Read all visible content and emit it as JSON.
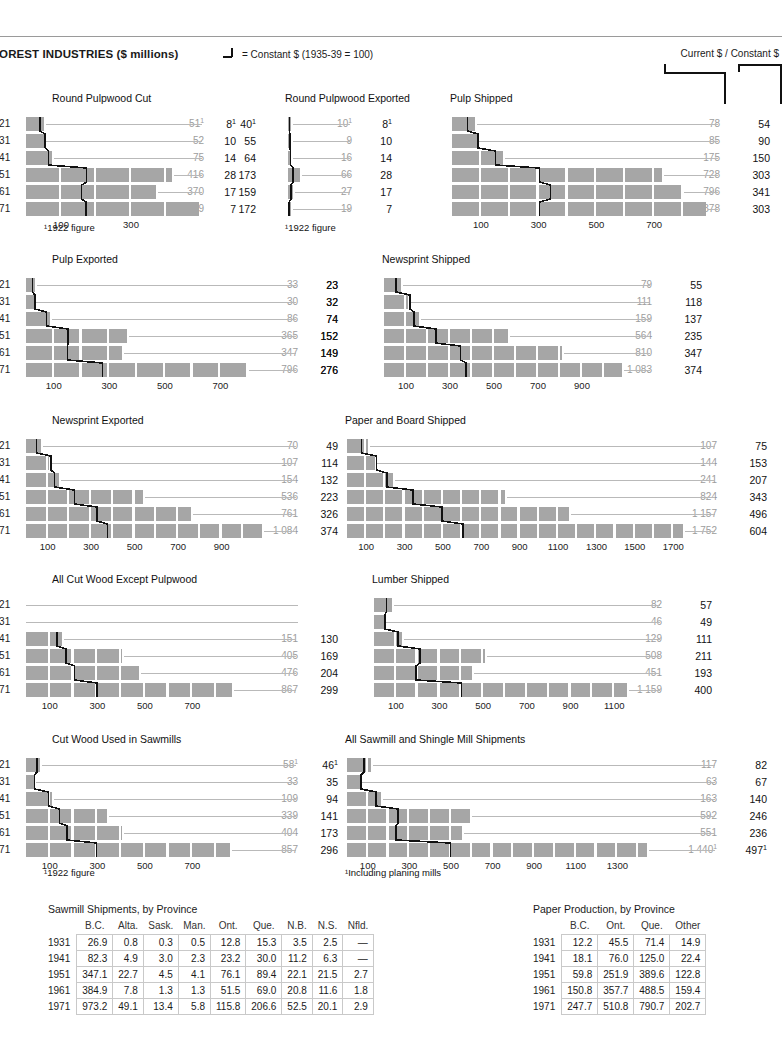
{
  "header": {
    "title": "FOREST INDUSTRIES ($ millions)",
    "legend_text": "= Constant $ (1935-39 = 100)",
    "legend_icon": "step-line-glyph",
    "columns_label": "Current $ / Constant $"
  },
  "years": [
    "1921",
    "1931",
    "1941",
    "1951",
    "1961",
    "1971"
  ],
  "table_years": [
    "1931",
    "1941",
    "1951",
    "1961",
    "1971"
  ],
  "footnotes": {
    "fig1922": "¹1922 figure",
    "planing": "¹Including planing mills"
  },
  "chart_data": [
    {
      "id": "round-pulpwood-cut",
      "type": "bar",
      "title": "Round Pulpwood Cut",
      "xlabel": "",
      "ylabel": "",
      "categories": [
        "1921",
        "1931",
        "1941",
        "1951",
        "1961",
        "1971"
      ],
      "xmax": 560,
      "ticks": [
        100,
        300
      ],
      "series": [
        {
          "name": "Current $",
          "values": [
            51,
            52,
            75,
            416,
            370,
            499
          ],
          "labels": [
            "51¹",
            "52",
            "75",
            "416",
            "370",
            "499"
          ]
        },
        {
          "name": "Constant $",
          "values": [
            40,
            55,
            64,
            173,
            159,
            172
          ],
          "labels": [
            "40¹",
            "55",
            "64",
            "173",
            "159",
            "172"
          ]
        }
      ],
      "footnote": "¹1922 figure",
      "left_values": null
    },
    {
      "id": "round-pulpwood-exported",
      "type": "bar",
      "title": "Round Pulpwood Exported",
      "categories": [
        "1921",
        "1931",
        "1941",
        "1951",
        "1961",
        "1971"
      ],
      "xmax": 560,
      "ticks": [],
      "series": [
        {
          "name": "Current $",
          "values": [
            10,
            9,
            16,
            66,
            27,
            19
          ],
          "labels": [
            "10¹",
            "9",
            "16",
            "66",
            "27",
            "19"
          ]
        },
        {
          "name": "Constant $",
          "values": [
            8,
            10,
            14,
            28,
            17,
            7
          ],
          "labels": [
            "8¹",
            "10",
            "14",
            "28",
            "17",
            "7"
          ]
        }
      ],
      "footnote": "¹1922 figure",
      "left_values": [
        "8¹",
        "10",
        "14",
        "28",
        "17",
        "7"
      ]
    },
    {
      "id": "pulp-shipped",
      "type": "bar",
      "title": "Pulp Shipped",
      "categories": [
        "1921",
        "1931",
        "1941",
        "1951",
        "1961",
        "1971"
      ],
      "xmax": 900,
      "ticks": [
        100,
        300,
        500,
        700
      ],
      "series": [
        {
          "name": "Current $",
          "values": [
            78,
            85,
            175,
            728,
            796,
            878
          ],
          "labels": [
            "78",
            "85",
            "175",
            "728",
            "796",
            "878"
          ]
        },
        {
          "name": "Constant $",
          "values": [
            54,
            90,
            150,
            303,
            341,
            303
          ],
          "labels": [
            "54",
            "90",
            "150",
            "303",
            "341",
            "303"
          ]
        }
      ],
      "footnote": null,
      "left_values": null
    },
    {
      "id": "pulp-exported",
      "type": "bar",
      "title": "Pulp Exported",
      "categories": [
        "1921",
        "1931",
        "1941",
        "1951",
        "1961",
        "1971"
      ],
      "xmax": 900,
      "ticks": [
        100,
        300,
        500,
        700
      ],
      "series": [
        {
          "name": "Current $",
          "values": [
            33,
            30,
            86,
            365,
            347,
            796
          ],
          "labels": [
            "33",
            "30",
            "86",
            "365",
            "347",
            "796"
          ]
        },
        {
          "name": "Constant $",
          "values": [
            23,
            32,
            74,
            152,
            149,
            276
          ],
          "labels": [
            "23",
            "32",
            "74",
            "152",
            "149",
            "276"
          ]
        }
      ],
      "footnote": null,
      "left_values": null
    },
    {
      "id": "newsprint-shipped",
      "type": "bar",
      "title": "Newsprint Shipped",
      "categories": [
        "1921",
        "1931",
        "1941",
        "1951",
        "1961",
        "1971"
      ],
      "xmax": 1150,
      "ticks": [
        100,
        300,
        500,
        700,
        900
      ],
      "series": [
        {
          "name": "Current $",
          "values": [
            79,
            111,
            159,
            564,
            810,
            1083
          ],
          "labels": [
            "79",
            "111",
            "159",
            "564",
            "810",
            "1 083"
          ]
        },
        {
          "name": "Constant $",
          "values": [
            55,
            118,
            137,
            235,
            347,
            374
          ],
          "labels": [
            "55",
            "118",
            "137",
            "235",
            "347",
            "374"
          ]
        }
      ],
      "footnote": null,
      "left_values": [
        "23",
        "32",
        "74",
        "152",
        "149",
        "276"
      ]
    },
    {
      "id": "newsprint-exported",
      "type": "bar",
      "title": "Newsprint Exported",
      "categories": [
        "1921",
        "1931",
        "1941",
        "1951",
        "1961",
        "1971"
      ],
      "xmax": 1150,
      "ticks": [
        100,
        300,
        500,
        700,
        900
      ],
      "series": [
        {
          "name": "Current $",
          "values": [
            70,
            107,
            154,
            536,
            761,
            1084
          ],
          "labels": [
            "70",
            "107",
            "154",
            "536",
            "761",
            "1 084"
          ]
        },
        {
          "name": "Constant $",
          "values": [
            49,
            114,
            132,
            223,
            326,
            374
          ],
          "labels": [
            "49",
            "114",
            "132",
            "223",
            "326",
            "374"
          ]
        }
      ],
      "footnote": null,
      "left_values": null
    },
    {
      "id": "paper-and-board-shipped",
      "type": "bar",
      "title": "Paper and Board Shipped",
      "categories": [
        "1921",
        "1931",
        "1941",
        "1951",
        "1961",
        "1971"
      ],
      "xmax": 1850,
      "ticks": [
        100,
        300,
        500,
        700,
        900,
        1100,
        1300,
        1500,
        1700
      ],
      "series": [
        {
          "name": "Current $",
          "values": [
            107,
            144,
            241,
            824,
            1157,
            1752
          ],
          "labels": [
            "107",
            "144",
            "241",
            "824",
            "1 157",
            "1 752"
          ]
        },
        {
          "name": "Constant $",
          "values": [
            75,
            153,
            207,
            343,
            496,
            604
          ],
          "labels": [
            "75",
            "153",
            "207",
            "343",
            "496",
            "604"
          ]
        }
      ],
      "footnote": null,
      "left_values": null
    },
    {
      "id": "all-cut-wood-except-pulpwood",
      "type": "bar",
      "title": "All Cut Wood Except Pulpwood",
      "categories": [
        "1921",
        "1931",
        "1941",
        "1951",
        "1961",
        "1971"
      ],
      "xmax": 900,
      "ticks": [
        100,
        300,
        500,
        700
      ],
      "series": [
        {
          "name": "Current $",
          "values": [
            null,
            null,
            151,
            405,
            476,
            867
          ],
          "labels": [
            "",
            "",
            "151",
            "405",
            "476",
            "867"
          ]
        },
        {
          "name": "Constant $",
          "values": [
            null,
            null,
            130,
            169,
            204,
            299
          ],
          "labels": [
            "",
            "",
            "130",
            "169",
            "204",
            "299"
          ]
        }
      ],
      "footnote": null,
      "left_values": [
        "",
        "",
        "130",
        "169",
        "204",
        "299"
      ]
    },
    {
      "id": "lumber-shipped",
      "type": "bar",
      "title": "Lumber Shipped",
      "categories": [
        "1921",
        "1931",
        "1941",
        "1951",
        "1961",
        "1971"
      ],
      "xmax": 1250,
      "ticks": [
        100,
        300,
        500,
        700,
        900,
        1100
      ],
      "series": [
        {
          "name": "Current $",
          "values": [
            82,
            46,
            129,
            508,
            451,
            1159
          ],
          "labels": [
            "82",
            "46",
            "129",
            "508",
            "451",
            "1 159"
          ]
        },
        {
          "name": "Constant $",
          "values": [
            57,
            49,
            111,
            211,
            193,
            400
          ],
          "labels": [
            "57",
            "49",
            "111",
            "211",
            "193",
            "400"
          ]
        }
      ],
      "footnote": null,
      "left_values": null
    },
    {
      "id": "cut-wood-used-in-sawmills",
      "type": "bar",
      "title": "Cut Wood Used in Sawmills",
      "categories": [
        "1921",
        "1931",
        "1941",
        "1951",
        "1961",
        "1971"
      ],
      "xmax": 900,
      "ticks": [
        100,
        300,
        500,
        700
      ],
      "series": [
        {
          "name": "Current $",
          "values": [
            58,
            33,
            109,
            339,
            404,
            857
          ],
          "labels": [
            "58¹",
            "33",
            "109",
            "339",
            "404",
            "857"
          ]
        },
        {
          "name": "Constant $",
          "values": [
            46,
            35,
            94,
            141,
            173,
            296
          ],
          "labels": [
            "46¹",
            "35",
            "94",
            "141",
            "173",
            "296"
          ]
        }
      ],
      "footnote": "¹1922 figure",
      "left_values": null
    },
    {
      "id": "all-sawmill-and-shingle-mill-shipments",
      "type": "bar",
      "title": "All Sawmill and Shingle Mill Shipments",
      "categories": [
        "1921",
        "1931",
        "1941",
        "1951",
        "1961",
        "1971"
      ],
      "xmax": 1500,
      "ticks": [
        100,
        300,
        500,
        700,
        900,
        1100,
        1300
      ],
      "series": [
        {
          "name": "Current $",
          "values": [
            117,
            63,
            163,
            592,
            551,
            1440
          ],
          "labels": [
            "117",
            "63",
            "163",
            "592",
            "551",
            "1 440¹"
          ]
        },
        {
          "name": "Constant $",
          "values": [
            82,
            67,
            140,
            246,
            236,
            497
          ],
          "labels": [
            "82",
            "67",
            "140",
            "246",
            "236",
            "497¹"
          ]
        }
      ],
      "footnote": "¹Including planing mills",
      "left_values": null
    }
  ],
  "tables": [
    {
      "id": "sawmill-shipments-by-province",
      "title": "Sawmill Shipments, by Province",
      "columns": [
        "B.C.",
        "Alta.",
        "Sask.",
        "Man.",
        "Ont.",
        "Que.",
        "N.B.",
        "N.S.",
        "Nfld."
      ],
      "rows": [
        {
          "year": "1931",
          "cells": [
            "26.9",
            "0.8",
            "0.3",
            "0.5",
            "12.8",
            "15.3",
            "3.5",
            "2.5",
            "—"
          ]
        },
        {
          "year": "1941",
          "cells": [
            "82.3",
            "4.9",
            "3.0",
            "2.3",
            "23.2",
            "30.0",
            "11.2",
            "6.3",
            "—"
          ]
        },
        {
          "year": "1951",
          "cells": [
            "347.1",
            "22.7",
            "4.5",
            "4.1",
            "76.1",
            "89.4",
            "22.1",
            "21.5",
            "2.7"
          ]
        },
        {
          "year": "1961",
          "cells": [
            "384.9",
            "7.8",
            "1.3",
            "1.3",
            "51.5",
            "69.0",
            "20.8",
            "11.6",
            "1.8"
          ]
        },
        {
          "year": "1971",
          "cells": [
            "973.2",
            "49.1",
            "13.4",
            "5.8",
            "115.8",
            "206.6",
            "52.5",
            "20.1",
            "2.9"
          ]
        }
      ]
    },
    {
      "id": "paper-production-by-province",
      "title": "Paper Production, by Province",
      "columns": [
        "B.C.",
        "Ont.",
        "Que.",
        "Other"
      ],
      "rows": [
        {
          "year": "1931",
          "cells": [
            "12.2",
            "45.5",
            "71.4",
            "14.9"
          ]
        },
        {
          "year": "1941",
          "cells": [
            "18.1",
            "76.0",
            "125.0",
            "22.4"
          ]
        },
        {
          "year": "1951",
          "cells": [
            "59.8",
            "251.9",
            "389.6",
            "122.8"
          ]
        },
        {
          "year": "1961",
          "cells": [
            "150.8",
            "357.7",
            "488.5",
            "159.4"
          ]
        },
        {
          "year": "1971",
          "cells": [
            "247.7",
            "510.8",
            "790.7",
            "202.7"
          ]
        }
      ]
    }
  ],
  "colors": {
    "bar": "#a6a6a6",
    "stepline": "#111111",
    "leader": "#b9b9b9",
    "current_value_text": "#9d9d9d",
    "constant_value_text": "#111111"
  },
  "layout": {
    "charts": [
      {
        "id": "round-pulpwood-cut",
        "x": 8,
        "y": 92,
        "titleX": 44,
        "plotX": 18,
        "plotW": 196,
        "valCurX": 196,
        "valConX": 248,
        "showYLabels": true,
        "footX": 36,
        "footY": 222,
        "axisY": 210
      },
      {
        "id": "round-pulpwood-exported",
        "x": 240,
        "y": 92,
        "titleX": 45,
        "plotX": 48,
        "plotW": 100,
        "valCurX": 112,
        "valConX": 152,
        "showYLabels": false,
        "leftValX": -4,
        "footX": 45,
        "footY": 222,
        "axisY": 210
      },
      {
        "id": "pulp-shipped",
        "x": 440,
        "y": 92,
        "titleX": 10,
        "plotX": 12,
        "plotW": 260,
        "valCurX": 280,
        "valConX": 330,
        "showYLabels": false,
        "axisY": 210
      },
      {
        "id": "pulp-exported",
        "x": 8,
        "y": 253,
        "titleX": 44,
        "plotX": 18,
        "plotW": 250,
        "valCurX": 290,
        "valConX": 330,
        "showYLabels": true,
        "axisY": 365
      },
      {
        "id": "newsprint-shipped",
        "x": 380,
        "y": 253,
        "titleX": 2,
        "plotX": 4,
        "plotW": 253,
        "valCurX": 272,
        "valConX": 322,
        "showYLabels": false,
        "leftValX": -42,
        "axisY": 365
      },
      {
        "id": "newsprint-exported",
        "x": 8,
        "y": 414,
        "titleX": 44,
        "plotX": 18,
        "plotW": 250,
        "valCurX": 290,
        "valConX": 330,
        "showYLabels": true,
        "axisY": 527
      },
      {
        "id": "paper-and-board-shipped",
        "x": 345,
        "y": 414,
        "titleX": 0,
        "plotX": 2,
        "plotW": 355,
        "valCurX": 372,
        "valConX": 422,
        "showYLabels": false,
        "axisY": 527
      },
      {
        "id": "all-cut-wood-except-pulpwood",
        "x": 8,
        "y": 573,
        "titleX": 44,
        "plotX": 18,
        "plotW": 214,
        "valCurX": 290,
        "valConX": 330,
        "showYLabels": true,
        "leftValX": null,
        "axisY": 685
      },
      {
        "id": "lumber-shipped",
        "x": 370,
        "y": 573,
        "titleX": 2,
        "plotX": 4,
        "plotW": 273,
        "valCurX": 292,
        "valConX": 342,
        "showYLabels": false,
        "axisY": 685
      },
      {
        "id": "cut-wood-used-in-sawmills",
        "x": 8,
        "y": 733,
        "titleX": 44,
        "plotX": 18,
        "plotW": 214,
        "valCurX": 290,
        "valConX": 330,
        "showYLabels": true,
        "footX": 36,
        "footY": 867,
        "axisY": 845
      },
      {
        "id": "all-sawmill-and-shingle-mill-shipments",
        "x": 345,
        "y": 733,
        "titleX": 0,
        "plotX": 2,
        "plotW": 312,
        "valCurX": 372,
        "valConX": 422,
        "showYLabels": false,
        "footX": 0,
        "footY": 867,
        "axisY": 845
      }
    ]
  }
}
